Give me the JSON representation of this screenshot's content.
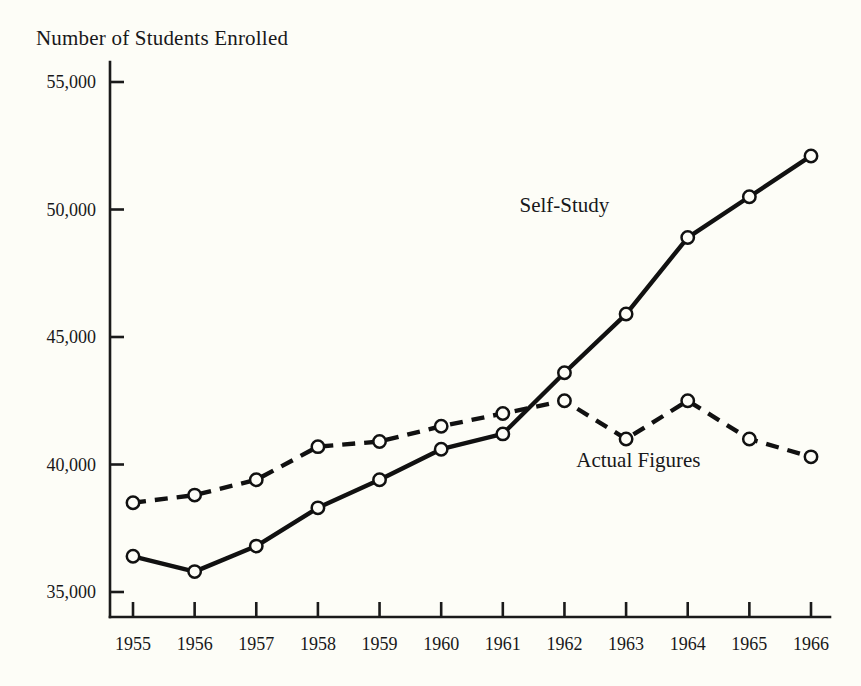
{
  "chart_data": {
    "type": "line",
    "title": "Number of Students Enrolled",
    "xlabel": "",
    "ylabel": "",
    "x": [
      1955,
      1956,
      1957,
      1958,
      1959,
      1960,
      1961,
      1962,
      1963,
      1964,
      1965,
      1966
    ],
    "categories": [
      "1955",
      "1956",
      "1957",
      "1958",
      "1959",
      "1960",
      "1961",
      "1962",
      "1963",
      "1964",
      "1965",
      "1966"
    ],
    "series": [
      {
        "name": "Self-Study",
        "style": "solid",
        "marker": "open-circle",
        "values": [
          36400,
          35800,
          36800,
          38300,
          39400,
          40600,
          41200,
          43600,
          45900,
          48900,
          50500,
          52100
        ]
      },
      {
        "name": "Actual Figures",
        "style": "dashed",
        "marker": "open-circle",
        "values": [
          38500,
          38800,
          39400,
          40700,
          40900,
          41500,
          42000,
          42500,
          41000,
          42500,
          41000,
          40300
        ]
      }
    ],
    "ylim": [
      33500,
      55800
    ],
    "xlim": [
      1954.6,
      1966.6
    ],
    "yticks": [
      35000,
      40000,
      45000,
      50000,
      55000
    ],
    "ytick_labels": [
      "35,000",
      "40,000",
      "45,000",
      "50,000",
      "55,000"
    ],
    "xticks": [
      1955,
      1956,
      1957,
      1958,
      1959,
      1960,
      1961,
      1962,
      1963,
      1964,
      1965,
      1966
    ],
    "xtick_labels": [
      "1955",
      "1956",
      "1957",
      "1958",
      "1959",
      "1960",
      "1961",
      "1962",
      "1963",
      "1964",
      "1965",
      "1966"
    ],
    "grid": false,
    "legend_position": "inline-annotation",
    "annotations": [
      {
        "text": "Self-Study",
        "x": 1962.0,
        "y": 49900
      },
      {
        "text": "Actual Figures",
        "x": 1963.2,
        "y": 39900
      }
    ],
    "colors": {
      "ink": "#111111",
      "background": "#fdfdf7",
      "marker_fill": "#fdfdf7"
    }
  }
}
